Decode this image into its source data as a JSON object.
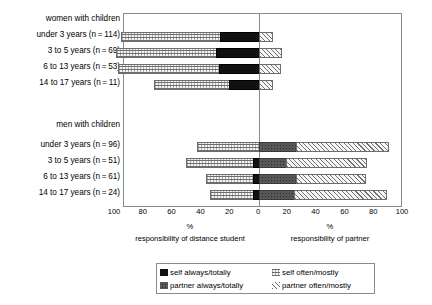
{
  "chart_data": {
    "type": "bar",
    "orientation": "horizontal",
    "subtype": "diverging-stacked-bar",
    "title": "",
    "xlabel": "%",
    "ylabel": "",
    "xlim": [
      -100,
      100
    ],
    "grid": false,
    "zero_line": 0,
    "axis": {
      "tick_labels": [
        "100",
        "80",
        "60",
        "40",
        "20",
        "0",
        "20",
        "40",
        "60",
        "80",
        "100"
      ],
      "tick_values": [
        -100,
        -80,
        -60,
        -40,
        -20,
        0,
        20,
        40,
        60,
        80,
        100
      ],
      "left_caption_pct": "%",
      "right_caption_pct": "%",
      "left_caption": "responsibility of distance student",
      "right_caption": "responsibility of partner"
    },
    "groups": [
      {
        "header": "women with children",
        "rows": [
          {
            "label": "under 3 years (n = 114)",
            "self_often_mostly": 69,
            "self_always_totally": 27,
            "partner_always_totally": 0,
            "partner_often_mostly": 10
          },
          {
            "label": "3 to 5 years (n = 69)",
            "self_often_mostly": 69,
            "self_always_totally": 30,
            "partner_always_totally": 0,
            "partner_often_mostly": 16
          },
          {
            "label": "6 to 13 years (n = 53)",
            "self_often_mostly": 70,
            "self_always_totally": 28,
            "partner_always_totally": 0,
            "partner_often_mostly": 15
          },
          {
            "label": "14 to 17 years (n = 11)",
            "self_often_mostly": 52,
            "self_always_totally": 21,
            "partner_always_totally": 0,
            "partner_often_mostly": 10
          }
        ]
      },
      {
        "header": "men with children",
        "rows": [
          {
            "label": "under 3 years (n = 96)",
            "self_often_mostly": 43,
            "self_always_totally": 0,
            "partner_always_totally": 26,
            "partner_often_mostly": 64
          },
          {
            "label": "3 to 5 years (n = 51)",
            "self_often_mostly": 47,
            "self_always_totally": 4,
            "partner_always_totally": 19,
            "partner_often_mostly": 56
          },
          {
            "label": "6 to 13 years (n = 61)",
            "self_often_mostly": 33,
            "self_always_totally": 4,
            "partner_always_totally": 26,
            "partner_often_mostly": 48
          },
          {
            "label": "14 to 17 years (n = 24)",
            "self_often_mostly": 30,
            "self_always_totally": 4,
            "partner_always_totally": 24,
            "partner_often_mostly": 65
          }
        ]
      }
    ],
    "legend": {
      "position": "bottom",
      "entries": [
        {
          "key": "self-always-totally",
          "label": "self always/totally",
          "pattern": "black-dotted"
        },
        {
          "key": "self-often-mostly",
          "label": "self often/mostly",
          "pattern": "light-fine-grid"
        },
        {
          "key": "partner-always-totally",
          "label": "partner always/totally",
          "pattern": "grey-dotted"
        },
        {
          "key": "partner-often-mostly",
          "label": "partner often/mostly",
          "pattern": "light-diagonal-hatch"
        }
      ]
    },
    "colors": {
      "self_always_totally": "#111111",
      "partner_always_totally": "#585858",
      "self_often_mostly": "#f4f4f4",
      "partner_often_mostly": "#f7f7f7",
      "frame": "#8a8a8a",
      "background": "#ffffff"
    }
  }
}
